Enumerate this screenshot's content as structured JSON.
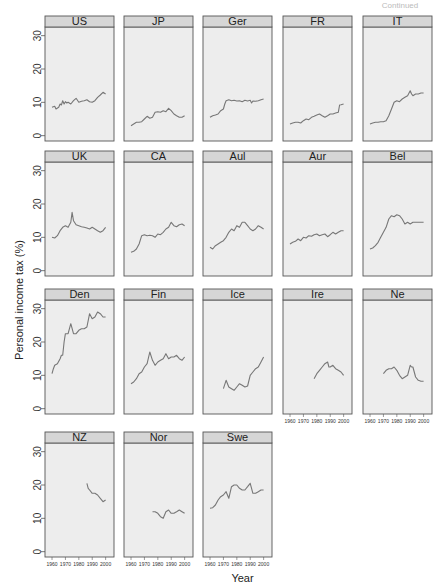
{
  "figure": {
    "xlabel": "Year",
    "ylabel": "Personal income tax (%)",
    "corner_text": "Continued"
  },
  "chart_data": {
    "type": "line",
    "layout": "small-multiples 5 columns x 4 rows",
    "xlabel": "Year",
    "ylabel": "Personal income tax (%)",
    "xlim": [
      1957,
      2004
    ],
    "ylim": [
      -1,
      32
    ],
    "x_ticks": [
      1960,
      1970,
      1980,
      1990,
      2000
    ],
    "y_ticks": [
      0,
      10,
      20,
      30
    ],
    "grid": false,
    "panels": [
      {
        "name": "US",
        "x": [
          1960,
          1962,
          1963,
          1965,
          1966,
          1967,
          1968,
          1969,
          1970,
          1971,
          1972,
          1974,
          1976,
          1978,
          1980,
          1982,
          1984,
          1986,
          1988,
          1990,
          1992,
          1994,
          1996,
          1998,
          2000
        ],
        "y": [
          8.5,
          8.8,
          8,
          8.5,
          9.5,
          9.2,
          10.5,
          9.5,
          10.2,
          9.8,
          10,
          9.5,
          10.5,
          11.2,
          10,
          10.3,
          10.5,
          10.8,
          10.2,
          10,
          10.5,
          11.5,
          12.2,
          13,
          12.5
        ]
      },
      {
        "name": "JP",
        "x": [
          1960,
          1962,
          1964,
          1966,
          1968,
          1970,
          1972,
          1974,
          1976,
          1978,
          1980,
          1982,
          1984,
          1986,
          1988,
          1990,
          1992,
          1994,
          1996,
          1998,
          2000
        ],
        "y": [
          3,
          3.5,
          4,
          4,
          4.2,
          5,
          5.8,
          5.2,
          5.5,
          7,
          7.2,
          7,
          7.5,
          7.2,
          8.2,
          7.5,
          6.5,
          6,
          5.5,
          5.5,
          6
        ]
      },
      {
        "name": "Ger",
        "x": [
          1960,
          1962,
          1964,
          1966,
          1968,
          1970,
          1971,
          1972,
          1974,
          1976,
          1978,
          1980,
          1982,
          1984,
          1986,
          1988,
          1990,
          1991,
          1992,
          1994,
          1996,
          1998,
          2000
        ],
        "y": [
          5.5,
          6,
          6.2,
          6.5,
          7.5,
          8,
          9.5,
          10.5,
          10.8,
          10.5,
          10.6,
          10.4,
          10.5,
          10.2,
          10.6,
          10.4,
          10.6,
          9.8,
          10.4,
          10.3,
          10.5,
          10.8,
          11
        ]
      },
      {
        "name": "FR",
        "x": [
          1960,
          1962,
          1964,
          1966,
          1968,
          1970,
          1972,
          1974,
          1976,
          1978,
          1980,
          1982,
          1984,
          1986,
          1988,
          1990,
          1992,
          1994,
          1996,
          1997,
          1998,
          2000
        ],
        "y": [
          3.5,
          3.8,
          4,
          4,
          3.8,
          4.5,
          5,
          4.8,
          5.5,
          5.8,
          6.2,
          6.5,
          6,
          5.5,
          6,
          6.5,
          6.5,
          6.8,
          7,
          9.2,
          9.3,
          9.5
        ]
      },
      {
        "name": "IT",
        "x": [
          1960,
          1962,
          1964,
          1966,
          1968,
          1970,
          1972,
          1974,
          1976,
          1978,
          1980,
          1982,
          1984,
          1986,
          1988,
          1990,
          1991,
          1992,
          1994,
          1996,
          1998,
          2000
        ],
        "y": [
          3.5,
          3.8,
          4,
          4,
          4.2,
          4.2,
          4.5,
          6,
          8,
          10,
          10.5,
          10.2,
          11,
          11.5,
          12,
          13.5,
          12.5,
          12,
          12.5,
          12.5,
          12.8,
          12.8
        ]
      },
      {
        "name": "UK",
        "x": [
          1960,
          1962,
          1964,
          1966,
          1968,
          1970,
          1972,
          1974,
          1975,
          1976,
          1978,
          1980,
          1982,
          1984,
          1986,
          1988,
          1990,
          1992,
          1994,
          1996,
          1998,
          2000
        ],
        "y": [
          10,
          9.8,
          10.5,
          12,
          13,
          13.5,
          13,
          14.5,
          17.5,
          15,
          13.8,
          13.5,
          13.2,
          13,
          12.8,
          12.5,
          13,
          12.5,
          12,
          11.5,
          12,
          13
        ]
      },
      {
        "name": "CA",
        "x": [
          1960,
          1962,
          1964,
          1966,
          1968,
          1970,
          1972,
          1974,
          1976,
          1978,
          1980,
          1982,
          1984,
          1986,
          1988,
          1990,
          1992,
          1994,
          1996,
          1998,
          2000
        ],
        "y": [
          5.5,
          5.8,
          6.5,
          8,
          10.5,
          10.8,
          10.5,
          10.6,
          10.5,
          10,
          11,
          10.8,
          11.5,
          12.5,
          13,
          14.5,
          13.5,
          13.2,
          13.8,
          14,
          13.5
        ]
      },
      {
        "name": "Aul",
        "x": [
          1960,
          1962,
          1964,
          1966,
          1968,
          1970,
          1972,
          1974,
          1976,
          1978,
          1980,
          1982,
          1984,
          1986,
          1988,
          1990,
          1992,
          1994,
          1996,
          1998,
          2000
        ],
        "y": [
          7,
          6.5,
          7.5,
          8,
          8.5,
          9,
          10,
          11.5,
          12.5,
          12,
          13.5,
          13,
          14.5,
          14.5,
          13.5,
          12.5,
          12,
          12.5,
          13.5,
          13,
          12.5
        ]
      },
      {
        "name": "Aur",
        "x": [
          1960,
          1962,
          1964,
          1966,
          1968,
          1970,
          1972,
          1974,
          1976,
          1978,
          1980,
          1982,
          1984,
          1986,
          1988,
          1990,
          1992,
          1994,
          1996,
          1998,
          2000
        ],
        "y": [
          8,
          8.5,
          8.8,
          9.5,
          9,
          10,
          9.8,
          10.5,
          10.3,
          10.8,
          11,
          10.5,
          10.8,
          11,
          10.2,
          10.8,
          11.5,
          11,
          11.5,
          12,
          12
        ]
      },
      {
        "name": "Bel",
        "x": [
          1960,
          1962,
          1964,
          1966,
          1968,
          1970,
          1972,
          1974,
          1976,
          1978,
          1980,
          1982,
          1984,
          1986,
          1988,
          1990,
          1992,
          1994,
          1996,
          1998,
          2000
        ],
        "y": [
          6.5,
          6.8,
          7.5,
          8.5,
          10,
          11.5,
          13,
          15.5,
          16.5,
          16.2,
          16.8,
          16.5,
          15.5,
          14,
          14.5,
          14,
          14.5,
          14.5,
          14.5,
          14.5,
          14.5
        ]
      },
      {
        "name": "Den",
        "x": [
          1960,
          1961,
          1962,
          1964,
          1966,
          1967,
          1968,
          1969,
          1970,
          1972,
          1974,
          1976,
          1978,
          1980,
          1982,
          1984,
          1986,
          1988,
          1990,
          1992,
          1994,
          1996,
          1998,
          2000
        ],
        "y": [
          10.5,
          12,
          13,
          13.5,
          15,
          16,
          16,
          20,
          22.5,
          22.5,
          25.5,
          22.5,
          22.5,
          23.5,
          24,
          24,
          24.5,
          28.5,
          27,
          27.5,
          29,
          28.5,
          27.5,
          27.5
        ]
      },
      {
        "name": "Fin",
        "x": [
          1960,
          1962,
          1964,
          1966,
          1968,
          1970,
          1972,
          1974,
          1976,
          1978,
          1980,
          1982,
          1984,
          1986,
          1988,
          1990,
          1992,
          1994,
          1996,
          1998,
          2000
        ],
        "y": [
          7.5,
          8,
          9,
          10.5,
          11,
          12.5,
          13.5,
          17,
          14.5,
          13,
          14,
          14.5,
          15,
          16.5,
          15,
          15.5,
          15.5,
          16,
          15,
          14.5,
          15.5
        ]
      },
      {
        "name": "Ice",
        "x": [
          1970,
          1972,
          1974,
          1976,
          1978,
          1980,
          1982,
          1984,
          1986,
          1988,
          1990,
          1992,
          1994,
          1996,
          1998,
          2000
        ],
        "y": [
          6,
          8.5,
          6.5,
          6,
          5.5,
          6.5,
          7.5,
          7,
          6.5,
          6.8,
          10,
          11,
          12,
          12.5,
          14,
          15.5
        ]
      },
      {
        "name": "Ire",
        "x": [
          1978,
          1980,
          1982,
          1984,
          1986,
          1988,
          1989,
          1990,
          1992,
          1994,
          1996,
          1998,
          2000
        ],
        "y": [
          9,
          10.5,
          11.5,
          12.5,
          13.5,
          14,
          12.5,
          12.5,
          13,
          12,
          11.5,
          11,
          10
        ]
      },
      {
        "name": "Ne",
        "x": [
          1970,
          1972,
          1974,
          1976,
          1978,
          1980,
          1982,
          1984,
          1986,
          1988,
          1990,
          1991,
          1992,
          1994,
          1996,
          1998,
          2000
        ],
        "y": [
          10.5,
          11.5,
          12,
          12,
          12.5,
          11.5,
          10,
          9,
          9.5,
          10,
          13,
          12.5,
          12.5,
          9.5,
          8.5,
          8.2,
          8.2
        ]
      },
      {
        "name": "NZ",
        "x": [
          1986,
          1987,
          1988,
          1989,
          1990,
          1992,
          1994,
          1996,
          1998,
          2000
        ],
        "y": [
          20.5,
          19,
          18.5,
          18,
          17.5,
          17.5,
          17,
          16,
          15,
          15.5
        ]
      },
      {
        "name": "Nor",
        "x": [
          1976,
          1978,
          1980,
          1982,
          1984,
          1986,
          1988,
          1990,
          1992,
          1994,
          1996,
          1998,
          2000
        ],
        "y": [
          12,
          12,
          11.5,
          10.5,
          10,
          12,
          12.5,
          11.5,
          11.5,
          12,
          12.5,
          12,
          11.5
        ]
      },
      {
        "name": "Swe",
        "x": [
          1960,
          1962,
          1964,
          1966,
          1968,
          1970,
          1972,
          1974,
          1976,
          1978,
          1980,
          1982,
          1984,
          1986,
          1988,
          1990,
          1992,
          1994,
          1996,
          1998,
          2000
        ],
        "y": [
          13,
          13.2,
          14,
          15.5,
          16.5,
          17,
          18,
          16,
          19.5,
          20,
          20,
          19,
          18.5,
          18.5,
          19.5,
          20.5,
          17.5,
          17.5,
          18,
          18.5,
          18.5
        ]
      }
    ]
  }
}
